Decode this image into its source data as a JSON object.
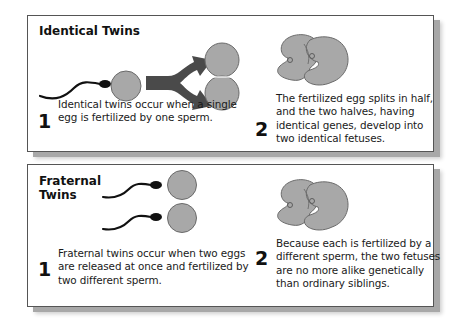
{
  "panels": [
    {
      "title": "Identical Twins",
      "steps": [
        {
          "number": "1",
          "text": "Identical twins occur when a single egg is fertilized by one sperm."
        },
        {
          "number": "2",
          "text": "The fertilized egg splits in half, and the two halves, having identical genes, develop into two identical fetuses."
        }
      ],
      "illustrations": [
        "sperm",
        "egg",
        "split-arrow",
        "two-cell-egg",
        "two-fetuses"
      ]
    },
    {
      "title": "Fraternal Twins",
      "title_lines": [
        "Fraternal",
        "Twins"
      ],
      "steps": [
        {
          "number": "1",
          "text": "Fraternal twins occur when two eggs are released at once and fertilized by two different sperm."
        },
        {
          "number": "2",
          "text": "Because each is fertilized by a different sperm, the two fetuses are no more alike genetically than ordinary siblings."
        }
      ],
      "illustrations": [
        "sperm",
        "sperm",
        "egg",
        "egg",
        "two-fetuses"
      ]
    }
  ],
  "colors": {
    "egg_fill": "#a8a8a8",
    "egg_stroke": "#6a6a6a",
    "arrow": "#4a4a4a",
    "border": "#555555",
    "shadow": "#a8a8a8"
  }
}
